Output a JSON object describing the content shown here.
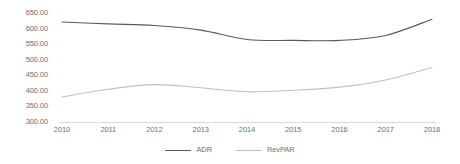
{
  "chart_data": {
    "type": "line",
    "title": "",
    "xlabel": "",
    "ylabel": "",
    "categories": [
      "2010",
      "2011",
      "2012",
      "2013",
      "2014",
      "2015",
      "2016",
      "2017",
      "2018"
    ],
    "ytick_labels": [
      "650.00",
      "600.00",
      "550.00",
      "500.00",
      "450.00",
      "400.00",
      "350.00",
      "300.00"
    ],
    "ytick_values": [
      650,
      600,
      550,
      500,
      450,
      400,
      350,
      300
    ],
    "ylim": [
      300,
      650
    ],
    "grid": false,
    "legend_position": "bottom",
    "series": [
      {
        "name": "ADR",
        "color": "#595959",
        "values": [
          621,
          615,
          610,
          595,
          565,
          562,
          562,
          578,
          630
        ]
      },
      {
        "name": "RevPAR",
        "color": "#bfbfbf",
        "values": [
          380,
          405,
          420,
          410,
          397,
          402,
          412,
          435,
          475
        ]
      }
    ]
  },
  "axis": {
    "baseline_color": "#d9d9d9",
    "tick_color": "#6f6f6f"
  }
}
